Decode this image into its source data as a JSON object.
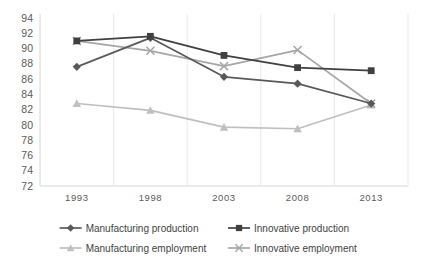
{
  "chart_data": {
    "type": "line",
    "title": "",
    "xlabel": "",
    "ylabel": "",
    "categories": [
      "1993",
      "1998",
      "2003",
      "2008",
      "2013"
    ],
    "x": [
      1993,
      1998,
      2003,
      2008,
      2013
    ],
    "ylim": [
      72,
      94
    ],
    "yticks": [
      72,
      74,
      76,
      78,
      80,
      82,
      84,
      86,
      88,
      90,
      92,
      94
    ],
    "grid": "vertical",
    "legend_position": "bottom",
    "series": [
      {
        "name": "Manufacturing production",
        "values": [
          87.6,
          91.4,
          86.3,
          85.4,
          82.8
        ],
        "color": "#595959",
        "marker": "diamond"
      },
      {
        "name": "Innovative production",
        "values": [
          91.0,
          91.6,
          89.1,
          87.5,
          87.1
        ],
        "color": "#404040",
        "marker": "square"
      },
      {
        "name": "Manufacturing employment",
        "values": [
          82.8,
          81.9,
          79.7,
          79.5,
          82.6
        ],
        "color": "#bfbfbf",
        "marker": "triangle"
      },
      {
        "name": "Innovative employment",
        "values": [
          91.0,
          89.7,
          87.7,
          89.8,
          82.8
        ],
        "color": "#a6a6a6",
        "marker": "cross"
      }
    ]
  },
  "axes": {
    "y_labels": [
      "94",
      "92",
      "90",
      "88",
      "86",
      "84",
      "82",
      "80",
      "78",
      "76",
      "74",
      "72"
    ],
    "x_labels": [
      "1993",
      "1998",
      "2003",
      "2008",
      "2013"
    ]
  },
  "legend": {
    "items": [
      {
        "label": "Manufacturing production",
        "color": "#595959",
        "marker": "diamond"
      },
      {
        "label": "Innovative production",
        "color": "#404040",
        "marker": "square"
      },
      {
        "label": "Manufacturing employment",
        "color": "#bfbfbf",
        "marker": "triangle"
      },
      {
        "label": "Innovative employment",
        "color": "#a6a6a6",
        "marker": "cross"
      }
    ]
  }
}
